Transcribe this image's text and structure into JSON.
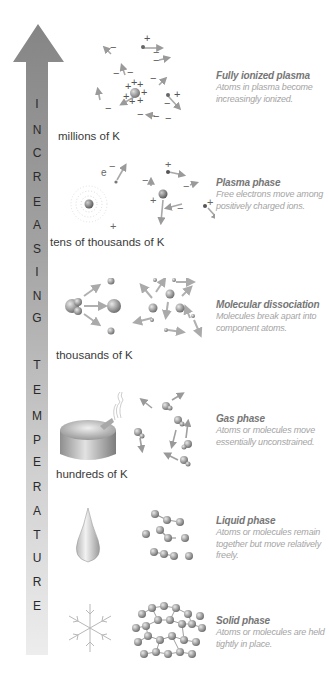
{
  "figure": {
    "axis": {
      "label": "INCREASING TEMPERATURE",
      "letters": [
        "I",
        "N",
        "C",
        "R",
        "E",
        "A",
        "S",
        "I",
        "N",
        "G",
        "T",
        "E",
        "M",
        "P",
        "E",
        "R",
        "A",
        "T",
        "U",
        "R",
        "E"
      ],
      "arrow_top_color": "#8a8a8a",
      "arrow_bottom_color": "#ececec"
    },
    "temperature_labels": [
      {
        "text": "millions of K"
      },
      {
        "text": "tens of thousands of K"
      },
      {
        "text": "thousands of K"
      },
      {
        "text": "hundreds of K"
      }
    ],
    "phases": [
      {
        "title": "Fully ionized plasma",
        "description": "Atoms in plasma become increasingly ionized.",
        "icon": "ionized-plasma-illustration"
      },
      {
        "title": "Plasma phase",
        "description": "Free electrons move among positively charged ions.",
        "icon": "plasma-phase-illustration"
      },
      {
        "title": "Molecular dissociation",
        "description": "Molecules break apart into component atoms.",
        "icon": "molecular-dissociation-illustration"
      },
      {
        "title": "Gas phase",
        "description": "Atoms or molecules move essentially unconstrained.",
        "icon": "gas-phase-illustration"
      },
      {
        "title": "Liquid phase",
        "description": "Atoms or molecules remain together but move relatively freely.",
        "icon": "liquid-phase-illustration"
      },
      {
        "title": "Solid phase",
        "description": "Atoms or molecules are held tightly in place.",
        "icon": "solid-phase-illustration"
      }
    ],
    "symbols": {
      "plus": "+",
      "minus": "−",
      "electron": "e"
    }
  }
}
